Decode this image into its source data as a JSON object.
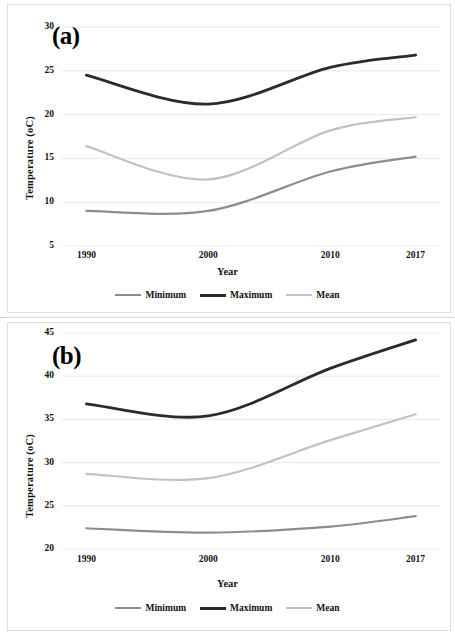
{
  "figure": {
    "panels": [
      {
        "tag": "(a)",
        "xlabel": "Year",
        "ylabel": "Temperature (oC)",
        "xticks": [
          "1990",
          "2000",
          "2010",
          "2017"
        ],
        "yticks": [
          "5",
          "10",
          "15",
          "20",
          "25",
          "30"
        ]
      },
      {
        "tag": "(b)",
        "xlabel": "Year",
        "ylabel": "Temperature (oC)",
        "xticks": [
          "1990",
          "2000",
          "2010",
          "2017"
        ],
        "yticks": [
          "20",
          "25",
          "30",
          "35",
          "40",
          "45"
        ]
      }
    ],
    "legend": [
      {
        "label": "Minimum",
        "color": "#8d8d8d",
        "width": 2.4
      },
      {
        "label": "Maximum",
        "color": "#2b2b2b",
        "width": 3.0
      },
      {
        "label": "Mean",
        "color": "#c2c2c2",
        "width": 2.4
      }
    ],
    "colors": {
      "minimum": "#8d8d8d",
      "maximum": "#2b2b2b",
      "mean": "#c2c2c2",
      "grid": "#e8e8e8",
      "frame": "#dedede",
      "text": "#111111"
    }
  },
  "chart_data": [
    {
      "type": "line",
      "title": "(a)",
      "xlabel": "Year",
      "ylabel": "Temperature (oC)",
      "x": [
        1990,
        2000,
        2010,
        2017
      ],
      "xlim": [
        1988,
        2019
      ],
      "ylim": [
        5,
        30
      ],
      "ytick_step": 5,
      "grid": true,
      "legend_position": "bottom",
      "smoothing": "spline",
      "series": [
        {
          "name": "Minimum",
          "values": [
            9.0,
            9.0,
            13.5,
            15.2
          ],
          "color": "#8d8d8d"
        },
        {
          "name": "Maximum",
          "values": [
            24.5,
            21.2,
            25.4,
            26.8
          ],
          "color": "#2b2b2b"
        },
        {
          "name": "Mean",
          "values": [
            16.4,
            12.6,
            18.2,
            19.7
          ],
          "color": "#c2c2c2"
        }
      ]
    },
    {
      "type": "line",
      "title": "(b)",
      "xlabel": "Year",
      "ylabel": "Temperature (oC)",
      "x": [
        1990,
        2000,
        2010,
        2017
      ],
      "xlim": [
        1988,
        2019
      ],
      "ylim": [
        20,
        45
      ],
      "ytick_step": 5,
      "grid": true,
      "legend_position": "bottom",
      "smoothing": "spline",
      "series": [
        {
          "name": "Minimum",
          "values": [
            22.4,
            21.9,
            22.6,
            23.8
          ],
          "color": "#8d8d8d"
        },
        {
          "name": "Maximum",
          "values": [
            36.8,
            35.4,
            40.9,
            44.2
          ],
          "color": "#2b2b2b"
        },
        {
          "name": "Mean",
          "values": [
            28.7,
            28.2,
            32.6,
            35.6
          ],
          "color": "#c2c2c2"
        }
      ]
    }
  ]
}
